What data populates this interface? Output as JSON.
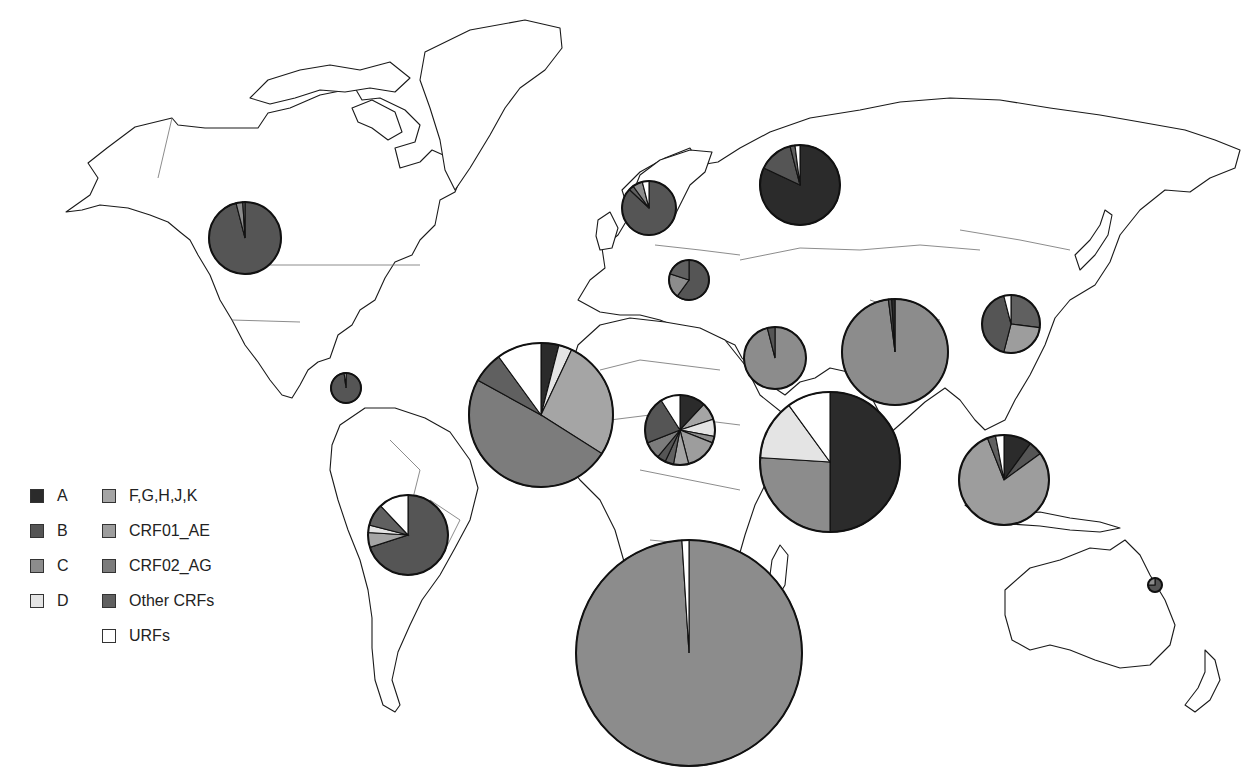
{
  "chart_data": {
    "type": "pie",
    "title": "",
    "legend": [
      {
        "key": "A",
        "label": "A",
        "color": "#2b2b2b"
      },
      {
        "key": "B",
        "label": "B",
        "color": "#555555"
      },
      {
        "key": "C",
        "label": "C",
        "color": "#8c8c8c"
      },
      {
        "key": "D",
        "label": "D",
        "color": "#e4e4e4"
      },
      {
        "key": "FGHJK",
        "label": "F,G,H,J,K",
        "color": "#a5a5a5"
      },
      {
        "key": "CRF01_AE",
        "label": "CRF01_AE",
        "color": "#9d9d9d"
      },
      {
        "key": "CRF02_AG",
        "label": "CRF02_AG",
        "color": "#7c7c7c"
      },
      {
        "key": "OtherCRFs",
        "label": "Other CRFs",
        "color": "#606060"
      },
      {
        "key": "URFs",
        "label": "URFs",
        "color": "#ffffff"
      }
    ],
    "regions": [
      {
        "name": "North America",
        "cx": 245,
        "cy": 238,
        "r": 36,
        "slices": [
          {
            "key": "B",
            "value": 96
          },
          {
            "key": "C",
            "value": 3
          },
          {
            "key": "OtherCRFs",
            "value": 1
          }
        ]
      },
      {
        "name": "Caribbean",
        "cx": 346,
        "cy": 388,
        "r": 15,
        "slices": [
          {
            "key": "B",
            "value": 98
          },
          {
            "key": "URFs",
            "value": 2
          }
        ]
      },
      {
        "name": "Latin America",
        "cx": 408,
        "cy": 535,
        "r": 40,
        "slices": [
          {
            "key": "B",
            "value": 70
          },
          {
            "key": "FGHJK",
            "value": 6
          },
          {
            "key": "D",
            "value": 3
          },
          {
            "key": "OtherCRFs",
            "value": 9
          },
          {
            "key": "URFs",
            "value": 12
          }
        ]
      },
      {
        "name": "Western Europe",
        "cx": 649,
        "cy": 208,
        "r": 27,
        "slices": [
          {
            "key": "B",
            "value": 87
          },
          {
            "key": "OtherCRFs",
            "value": 3
          },
          {
            "key": "C",
            "value": 6
          },
          {
            "key": "URFs",
            "value": 4
          }
        ]
      },
      {
        "name": "Central Europe",
        "cx": 689,
        "cy": 280,
        "r": 20,
        "slices": [
          {
            "key": "B",
            "value": 60
          },
          {
            "key": "C",
            "value": 20
          },
          {
            "key": "OtherCRFs",
            "value": 20
          }
        ]
      },
      {
        "name": "Eastern Europe / Central Asia",
        "cx": 800,
        "cy": 185,
        "r": 40,
        "slices": [
          {
            "key": "A",
            "value": 82
          },
          {
            "key": "B",
            "value": 14
          },
          {
            "key": "OtherCRFs",
            "value": 2
          },
          {
            "key": "URFs",
            "value": 2
          }
        ]
      },
      {
        "name": "North Africa / Middle East",
        "cx": 775,
        "cy": 358,
        "r": 31,
        "slices": [
          {
            "key": "C",
            "value": 96
          },
          {
            "key": "B",
            "value": 4
          }
        ]
      },
      {
        "name": "West Africa",
        "cx": 541,
        "cy": 415,
        "r": 72,
        "slices": [
          {
            "key": "A",
            "value": 4
          },
          {
            "key": "D",
            "value": 3
          },
          {
            "key": "FGHJK",
            "value": 27
          },
          {
            "key": "CRF02_AG",
            "value": 49
          },
          {
            "key": "OtherCRFs",
            "value": 7
          },
          {
            "key": "URFs",
            "value": 10
          }
        ]
      },
      {
        "name": "Central Africa",
        "cx": 680,
        "cy": 430,
        "r": 35,
        "slices": [
          {
            "key": "A",
            "value": 12
          },
          {
            "key": "FGHJK",
            "value": 8
          },
          {
            "key": "D",
            "value": 8
          },
          {
            "key": "C",
            "value": 3
          },
          {
            "key": "CRF01_AE",
            "value": 15
          },
          {
            "key": "FGHJK",
            "value": 7
          },
          {
            "key": "OtherCRFs",
            "value": 4
          },
          {
            "key": "B",
            "value": 4
          },
          {
            "key": "CRF02_AG",
            "value": 8
          },
          {
            "key": "B",
            "value": 22
          },
          {
            "key": "URFs",
            "value": 9
          }
        ]
      },
      {
        "name": "East Africa",
        "cx": 830,
        "cy": 462,
        "r": 70,
        "slices": [
          {
            "key": "A",
            "value": 50
          },
          {
            "key": "C",
            "value": 26
          },
          {
            "key": "D",
            "value": 14
          },
          {
            "key": "URFs",
            "value": 10
          }
        ]
      },
      {
        "name": "Southern Africa",
        "cx": 689,
        "cy": 653,
        "r": 113,
        "slices": [
          {
            "key": "C",
            "value": 99
          },
          {
            "key": "URFs",
            "value": 1
          }
        ]
      },
      {
        "name": "South Asia",
        "cx": 895,
        "cy": 352,
        "r": 53,
        "slices": [
          {
            "key": "C",
            "value": 98
          },
          {
            "key": "B",
            "value": 1
          },
          {
            "key": "A",
            "value": 1
          }
        ]
      },
      {
        "name": "East Asia",
        "cx": 1011,
        "cy": 324,
        "r": 29,
        "slices": [
          {
            "key": "OtherCRFs",
            "value": 27
          },
          {
            "key": "CRF01_AE",
            "value": 27
          },
          {
            "key": "B",
            "value": 42
          },
          {
            "key": "URFs",
            "value": 4
          }
        ]
      },
      {
        "name": "South-East Asia",
        "cx": 1004,
        "cy": 480,
        "r": 45,
        "slices": [
          {
            "key": "A",
            "value": 10
          },
          {
            "key": "B",
            "value": 5
          },
          {
            "key": "CRF01_AE",
            "value": 79
          },
          {
            "key": "OtherCRFs",
            "value": 3
          },
          {
            "key": "URFs",
            "value": 3
          }
        ]
      },
      {
        "name": "Oceania",
        "cx": 1155,
        "cy": 585,
        "r": 7,
        "slices": [
          {
            "key": "B",
            "value": 75
          },
          {
            "key": "C",
            "value": 25
          }
        ]
      }
    ]
  },
  "legend": {
    "col1": [
      "A",
      "B",
      "C",
      "D"
    ],
    "col2": [
      "F,G,H,J,K",
      "CRF01_AE",
      "CRF02_AG",
      "Other CRFs",
      "URFs"
    ]
  }
}
